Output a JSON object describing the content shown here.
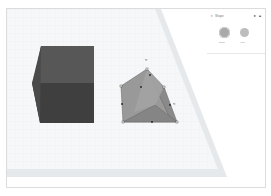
{
  "app": {
    "name": "3D Design Editor"
  },
  "inspector": {
    "title": "Shape",
    "collapse_icon": "chevron-icon",
    "icons": [
      "lightbulb-icon",
      "lock-icon"
    ],
    "options": [
      {
        "label": "Solid",
        "color": "#a9a9a9"
      },
      {
        "label": "Hole",
        "color": "#bdbdbd"
      }
    ]
  },
  "scene": {
    "objects": [
      {
        "name": "Box",
        "color": "#4a4a4a"
      },
      {
        "name": "Roof",
        "color": "#8f8f8f",
        "selected": true
      }
    ],
    "handles": {
      "rotate_top": "↻",
      "rotate_side": "↻"
    }
  },
  "colors": {
    "grid": "#eeeeee",
    "workplane": "#f4f6f8",
    "box": "#4a4a4a",
    "roof": "#8f8f8f"
  }
}
